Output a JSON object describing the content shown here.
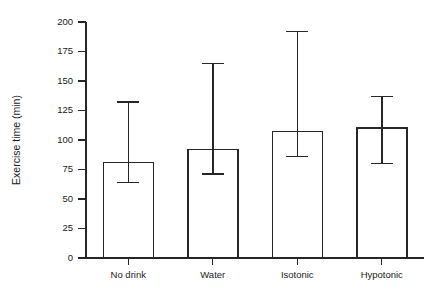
{
  "chart_data": {
    "type": "bar",
    "title": "",
    "xlabel": "",
    "ylabel": "Exercise time (min)",
    "categories": [
      "No drink",
      "Water",
      "Isotonic",
      "Hypotonic"
    ],
    "values": [
      81,
      92,
      107,
      110
    ],
    "error_upper": [
      132,
      165,
      192,
      137
    ],
    "error_lower": [
      64,
      71,
      86,
      80
    ],
    "errorbar_style": "capped-range",
    "ylim": [
      0,
      200
    ],
    "yticks": [
      0,
      25,
      50,
      75,
      100,
      125,
      150,
      175,
      200
    ],
    "ytick_labels": [
      "0",
      "25",
      "50",
      "75",
      "100",
      "125",
      "150",
      "175",
      "200"
    ],
    "grid": false,
    "legend": false,
    "legend_position": "none",
    "bar_fill": "#ffffff",
    "bar_stroke": "#262626",
    "axis_color": "#262626",
    "background": "#ffffff"
  },
  "axes": {
    "y_axis_label": "Exercise time (min)",
    "y_unit": "min"
  }
}
